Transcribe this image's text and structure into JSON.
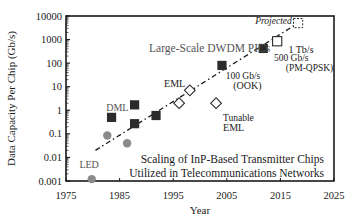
{
  "chart_data": {
    "type": "scatter",
    "title_lines": [
      "Scaling of InP-Based Transmitter Chips",
      "Utilized in Telecommunications Networks"
    ],
    "xlabel": "Year",
    "ylabel": "Data Capacity Per Chip (Gb/s)",
    "xlim": [
      1975,
      2025
    ],
    "ylim": [
      0.001,
      10000
    ],
    "yscale": "log",
    "x_ticks": [
      "1975",
      "1985",
      "1995",
      "2005",
      "2015",
      "2025"
    ],
    "x_tick_values": [
      1975,
      1985,
      1995,
      2005,
      2015,
      2025
    ],
    "y_ticks": [
      "0.001",
      "0.01",
      "0.1",
      "1",
      "10",
      "100",
      "1000",
      "10000"
    ],
    "y_tick_values": [
      0.001,
      0.01,
      0.1,
      1,
      10,
      100,
      1000,
      10000
    ],
    "grid": false,
    "series": [
      {
        "name": "LED",
        "marker": "circle",
        "color": "#8a8a8a",
        "points": [
          {
            "x": 1979.8,
            "y": 0.0012
          },
          {
            "x": 1982.7,
            "y": 0.085
          },
          {
            "x": 1986.4,
            "y": 0.04
          }
        ]
      },
      {
        "name": "DML / DWDM PICs",
        "marker": "square-filled",
        "color": "#2b2b2b",
        "points": [
          {
            "x": 1983.5,
            "y": 0.5
          },
          {
            "x": 1987.8,
            "y": 1.7
          },
          {
            "x": 1987.8,
            "y": 0.27
          },
          {
            "x": 1991.8,
            "y": 0.6
          },
          {
            "x": 2004.1,
            "y": 80
          },
          {
            "x": 2011.8,
            "y": 420
          }
        ]
      },
      {
        "name": "EML / Tunable EML",
        "marker": "diamond-open",
        "color": "#2b2b2b",
        "points": [
          {
            "x": 1996.1,
            "y": 2.0
          },
          {
            "x": 1998.1,
            "y": 7
          },
          {
            "x": 2003.0,
            "y": 2.0
          }
        ]
      },
      {
        "name": "1 Tb/s",
        "marker": "square-open",
        "color": "#2b2b2b",
        "points": [
          {
            "x": 2014.4,
            "y": 850
          }
        ]
      },
      {
        "name": "Projected",
        "marker": "square-dashed",
        "color": "#2b2b2b",
        "points": [
          {
            "x": 2018.3,
            "y": 5000
          }
        ]
      }
    ],
    "trendline": {
      "style": "dash-dot",
      "from": {
        "x": 1980.5,
        "y": 0.02
      },
      "to": {
        "x": 2018.3,
        "y": 5000
      }
    },
    "annotations": [
      {
        "text": "Large-Scale  DWDM PICs",
        "x": 1990.5,
        "y": 300
      },
      {
        "text": "DML",
        "x": 1982.5,
        "y": 0.9
      },
      {
        "text": "EML",
        "x": 1993.3,
        "y": 10
      },
      {
        "text": "Tunable",
        "x": 2004.3,
        "y": 0.35
      },
      {
        "text": "EML",
        "x": 2004.3,
        "y": 0.13
      },
      {
        "text": "100 Gb/s",
        "x": 2004.8,
        "y": 22
      },
      {
        "text": "(OOK)",
        "x": 2006.2,
        "y": 8
      },
      {
        "text": "500 Gb/s",
        "x": 2013.8,
        "y": 120
      },
      {
        "text": "(PM-QPSK)",
        "x": 2016.0,
        "y": 45
      },
      {
        "text": "1 Tb/s",
        "x": 2016.5,
        "y": 280
      },
      {
        "text": "Projected",
        "x": 2010.3,
        "y": 4500
      },
      {
        "text": "LED",
        "x": 1977.5,
        "y": 0.0035
      }
    ]
  }
}
